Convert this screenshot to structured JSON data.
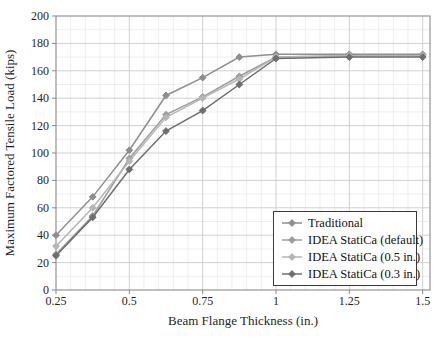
{
  "figure": {
    "background": "#ffffff",
    "frame_color": "#8a8a8a",
    "major_grid_color": "#cccccc",
    "minor_grid_color": "#e7e7e7",
    "text_color": "#1f1f1f"
  },
  "chart_data": {
    "type": "line",
    "title": "",
    "xlabel": "Beam Flange Thickness (in.)",
    "ylabel": "Maximum Factored Tensile Load (kips)",
    "x": [
      0.25,
      0.375,
      0.5,
      0.625,
      0.75,
      0.875,
      1,
      1.25,
      1.5
    ],
    "xlim": [
      0.25,
      1.525
    ],
    "ylim": [
      0,
      200
    ],
    "xticks": [
      0.25,
      0.5,
      0.75,
      1,
      1.25,
      1.5
    ],
    "xtick_labels": [
      "0.25",
      "0.5",
      "0.75",
      "1",
      "1.25",
      "1.5"
    ],
    "yticks": [
      0,
      20,
      40,
      60,
      80,
      100,
      120,
      140,
      160,
      180,
      200
    ],
    "ytick_labels": [
      "0",
      "20",
      "40",
      "60",
      "80",
      "100",
      "120",
      "140",
      "160",
      "180",
      "200"
    ],
    "x_minor_step": 0.05,
    "y_minor_step": 10,
    "grid": "major+minor",
    "legend_position": "lower right",
    "marker": "diamond",
    "series": [
      {
        "name": "Traditional",
        "color": "#8f8f8f",
        "values": [
          40,
          68,
          102,
          142,
          155,
          170,
          172,
          172,
          172
        ]
      },
      {
        "name": "IDEA StatiCa (default)",
        "color": "#9d9d9d",
        "values": [
          26,
          54,
          96,
          128,
          141,
          156,
          170,
          171,
          171
        ]
      },
      {
        "name": "IDEA StatiCa (0.5 in.)",
        "color": "#b6b6b6",
        "values": [
          32,
          60,
          94,
          126,
          140,
          154,
          170,
          171,
          171
        ]
      },
      {
        "name": "IDEA StatiCa (0.3 in.)",
        "color": "#6e6e6e",
        "values": [
          25,
          53,
          88,
          116,
          131,
          150,
          169,
          170,
          170
        ]
      }
    ]
  }
}
